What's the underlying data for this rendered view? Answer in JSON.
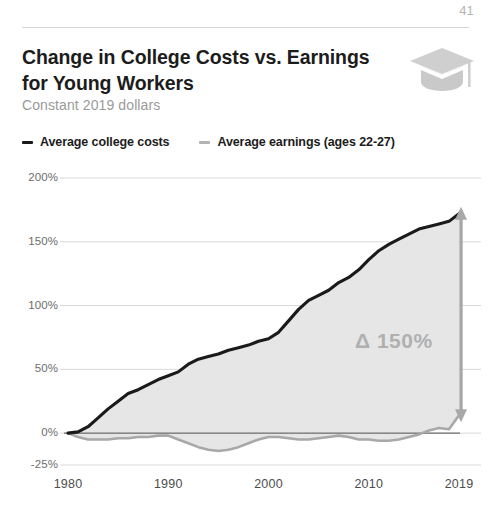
{
  "page": {
    "number": "41"
  },
  "header": {
    "title": "Change in College Costs vs. Earnings for Young Workers",
    "subtitle": "Constant 2019 dollars",
    "icon": "graduation-cap-icon"
  },
  "legend": {
    "items": [
      {
        "label": "Average college costs",
        "color": "#1a1a1a",
        "icon": "legend-dash-icon"
      },
      {
        "label": "Average earnings (ages 22-27)",
        "color": "#b3b3b3",
        "icon": "legend-dash-icon"
      }
    ]
  },
  "annotation": {
    "delta_text": "Δ 150%",
    "delta_symbol": "Δ",
    "delta_value": "150%"
  },
  "colors": {
    "costs_line": "#1a1a1a",
    "earnings_line": "#a8a8a8",
    "area_fill": "#e6e6e6",
    "grid": "#d9d9d9",
    "zero_axis": "#4d4d4d",
    "delta_arrow": "#a8a8a8",
    "subtitle": "#9a9a9a",
    "page_number": "#b4b4b4",
    "cap_icon": "#cfcfcf"
  },
  "chart_data": {
    "type": "area",
    "title": "Change in College Costs vs. Earnings for Young Workers",
    "subtitle": "Constant 2019 dollars",
    "xlabel": "",
    "ylabel": "",
    "xlim": [
      1980,
      2019
    ],
    "ylim": [
      -25,
      200
    ],
    "grid": true,
    "legend_position": "top-left",
    "y_ticks": [
      {
        "value": 200,
        "label": "200%"
      },
      {
        "value": 150,
        "label": "150%"
      },
      {
        "value": 100,
        "label": "100%"
      },
      {
        "value": 50,
        "label": "50%"
      },
      {
        "value": 0,
        "label": "0%"
      },
      {
        "value": -25,
        "label": "-25%"
      }
    ],
    "x_ticks": [
      {
        "value": 1980,
        "label": "1980"
      },
      {
        "value": 1990,
        "label": "1990"
      },
      {
        "value": 2000,
        "label": "2000"
      },
      {
        "value": 2010,
        "label": "2010"
      },
      {
        "value": 2019,
        "label": "2019"
      }
    ],
    "x": [
      1980,
      1981,
      1982,
      1983,
      1984,
      1985,
      1986,
      1987,
      1988,
      1989,
      1990,
      1991,
      1992,
      1993,
      1994,
      1995,
      1996,
      1997,
      1998,
      1999,
      2000,
      2001,
      2002,
      2003,
      2004,
      2005,
      2006,
      2007,
      2008,
      2009,
      2010,
      2011,
      2012,
      2013,
      2014,
      2015,
      2016,
      2017,
      2018,
      2019
    ],
    "series": [
      {
        "name": "Average college costs",
        "color": "#1a1a1a",
        "units": "percent change",
        "values": [
          0,
          1,
          5,
          12,
          19,
          25,
          31,
          34,
          38,
          42,
          45,
          48,
          54,
          58,
          60,
          62,
          65,
          67,
          69,
          72,
          74,
          79,
          88,
          97,
          104,
          108,
          112,
          118,
          122,
          128,
          136,
          143,
          148,
          152,
          156,
          160,
          162,
          164,
          166,
          172
        ]
      },
      {
        "name": "Average earnings (ages 22-27)",
        "color": "#a8a8a8",
        "units": "percent change",
        "values": [
          0,
          -3,
          -5,
          -5,
          -5,
          -4,
          -4,
          -3,
          -3,
          -2,
          -2,
          -5,
          -8,
          -11,
          -13,
          -14,
          -13,
          -11,
          -8,
          -5,
          -3,
          -3,
          -4,
          -5,
          -5,
          -4,
          -3,
          -2,
          -3,
          -5,
          -5,
          -6,
          -6,
          -5,
          -3,
          -1,
          2,
          4,
          3,
          14
        ]
      }
    ],
    "annotations": [
      {
        "type": "double-arrow",
        "text": "Δ 150%",
        "x": 2019,
        "y_from": 14,
        "y_to": 172
      }
    ]
  }
}
